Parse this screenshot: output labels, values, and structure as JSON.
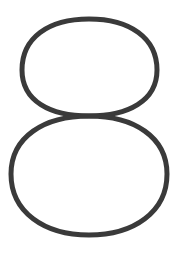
{
  "glyph": {
    "name": "digit-eight",
    "character": "8",
    "style": "outline",
    "stroke_color": "#3a3a3a",
    "background_color": "#ffffff",
    "stroke_width": 5
  }
}
